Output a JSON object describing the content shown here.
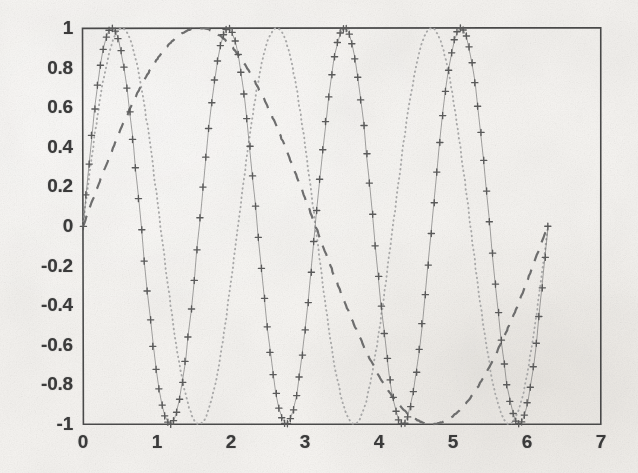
{
  "figure": {
    "kind": "scanned-plot",
    "background_color": "#f7f5f2",
    "axis_color": "#4a4a4a",
    "box_left_px": 83,
    "box_right_px": 601,
    "box_top_px": 28,
    "box_bottom_px": 424
  },
  "chart_data": {
    "type": "line",
    "title": "",
    "subtitle": "",
    "xlabel": "",
    "ylabel": "",
    "xlim": [
      0,
      7
    ],
    "ylim": [
      -1,
      1
    ],
    "xticks": [
      0,
      1,
      2,
      3,
      4,
      5,
      6,
      7
    ],
    "xticklabels": [
      "0",
      "1",
      "2",
      "3",
      "4",
      "5",
      "6",
      "7"
    ],
    "yticks": [
      -1,
      -0.8,
      -0.6,
      -0.4,
      -0.2,
      0,
      0.2,
      0.4,
      0.6,
      0.8,
      1
    ],
    "yticklabels": [
      "-1",
      "-0.8",
      "-0.6",
      "-0.4",
      "-0.2",
      "0",
      "0.2",
      "0.4",
      "0.6",
      "0.8",
      "1"
    ],
    "grid": false,
    "legend": null,
    "legend_position": "none",
    "x_domain": [
      0,
      6.283185307179586
    ],
    "series": [
      {
        "name": "sin(4x)",
        "style": "marker-plus",
        "linestyle": "none",
        "marker": "+",
        "color": "#5a5a5a",
        "amplitude": 1,
        "frequency": 4,
        "phase": 0,
        "n_points": 160,
        "peaks_x": [
          0.3927,
          1.9635,
          3.5343,
          5.1051
        ],
        "troughs_x": [
          1.1781,
          2.7489,
          4.3197,
          5.8905
        ]
      },
      {
        "name": "sin(3x)",
        "style": "dotted",
        "linestyle": "dotted",
        "marker": "none",
        "color": "#a8a8a8",
        "amplitude": 1,
        "frequency": 3,
        "phase": 0,
        "n_points": 420,
        "peaks_x": [
          0.5236,
          2.618,
          4.712
        ],
        "troughs_x": [
          1.5708,
          3.6652,
          5.7596
        ]
      },
      {
        "name": "sin(x)",
        "style": "dashed",
        "linestyle": "dashed",
        "marker": "none",
        "color": "#6e6e6e",
        "amplitude": 1,
        "frequency": 1,
        "phase": 0,
        "n_points": 420,
        "peaks_x": [
          1.5708
        ],
        "troughs_x": [
          4.712
        ]
      }
    ]
  }
}
